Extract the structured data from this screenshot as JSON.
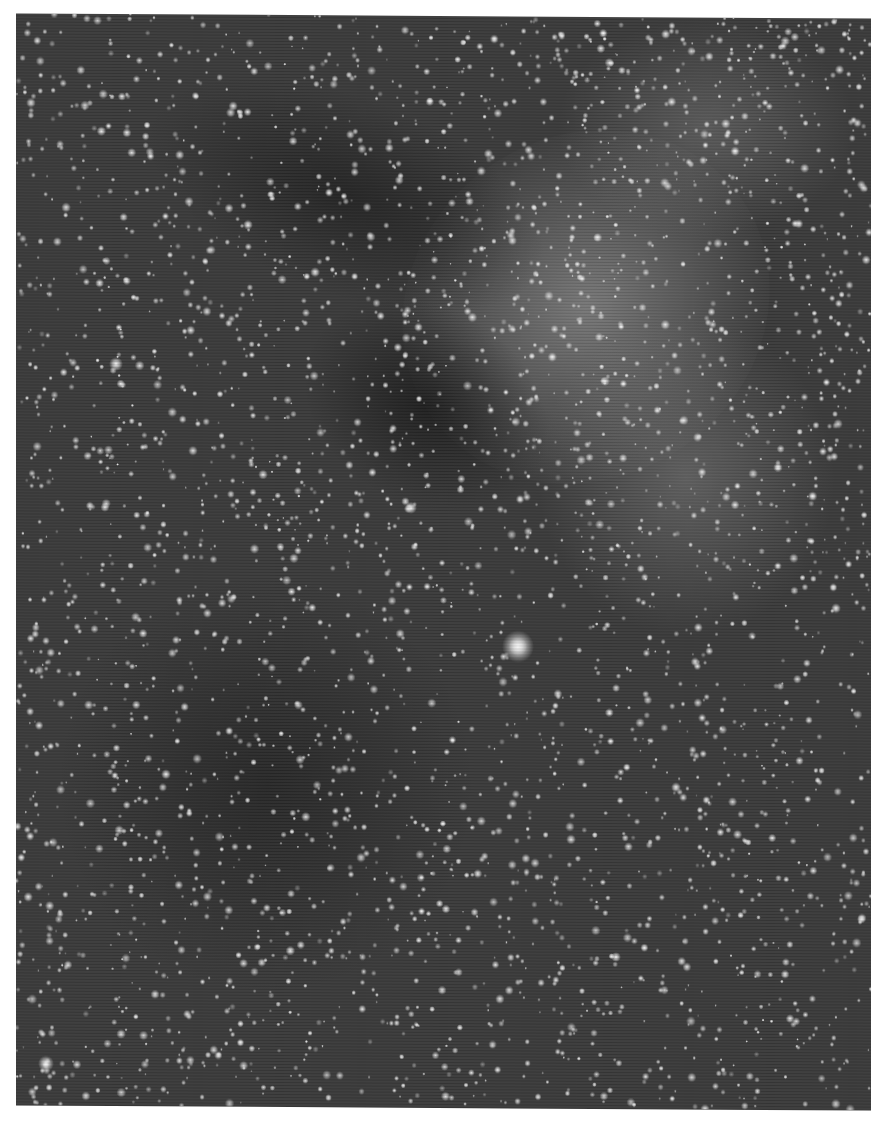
{
  "image": {
    "kind": "photograph",
    "subject": "dense star field (astronomical plate)",
    "tone": "grayscale",
    "colors": {
      "page": "#ffffff",
      "sky": "#3a3a3a",
      "dust_lane": "#262626",
      "nebulosity": "#9a9a9a",
      "star": "#f2f2f2"
    },
    "features": [
      {
        "name": "bright-nebulous-region",
        "position": "upper right, diagonal band from center-left to top-right"
      },
      {
        "name": "dark-dust-lane",
        "position": "upper left and center-left, running diagonally"
      },
      {
        "name": "bright-star",
        "position": "center, slightly below middle"
      },
      {
        "name": "dense-star-field",
        "position": "lower half"
      }
    ]
  }
}
